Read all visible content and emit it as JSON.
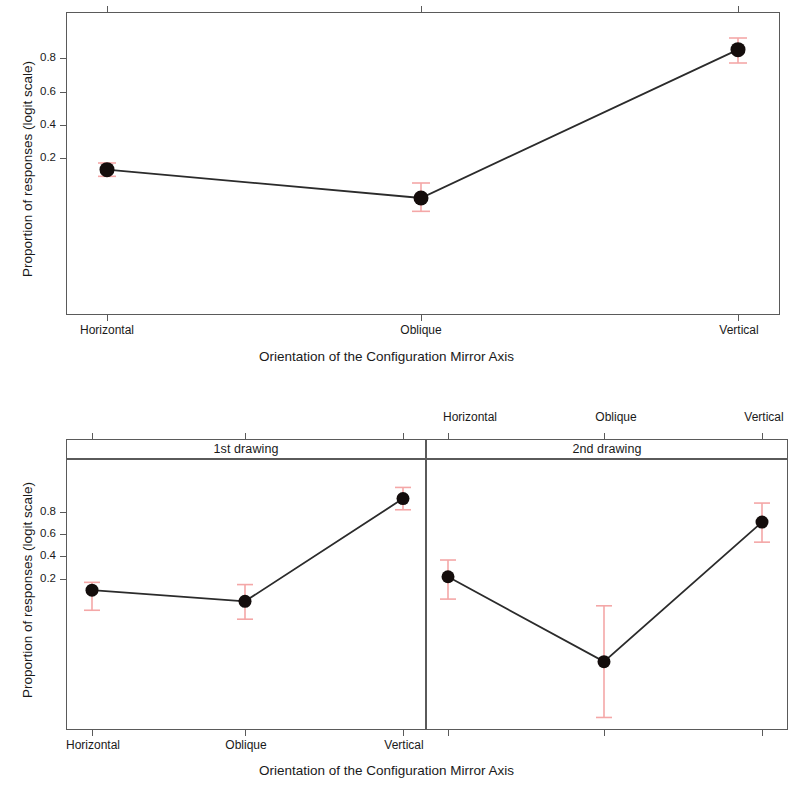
{
  "figure": {
    "ylabel": "Proportion of responses (logit scale)",
    "xlabel": "Orientation of the Configuration Mirror Axis",
    "categories": [
      "Horizontal",
      "Oblique",
      "Vertical"
    ],
    "ytick_labels": [
      "0.2",
      "0.4",
      "0.6",
      "0.8"
    ],
    "strip_labels": [
      "1st drawing",
      "2nd drawing"
    ],
    "colors": {
      "point": "#140d0c",
      "line": "#2b2b2b",
      "error_bar": "#f4a7a7",
      "frame": "#5a5a5a",
      "background": "#ffffff"
    }
  },
  "chart_data": [
    {
      "type": "line",
      "id": "top-panel",
      "title": "",
      "xlabel": "Orientation of the Configuration Mirror Axis",
      "ylabel": "Proportion of responses (logit scale)",
      "categories": [
        "Horizontal",
        "Oblique",
        "Vertical"
      ],
      "values": [
        0.13,
        -0.04,
        0.85
      ],
      "error_low": [
        0.09,
        -0.12,
        0.77
      ],
      "error_high": [
        0.17,
        0.05,
        0.92
      ],
      "ytick_values": [
        0.2,
        0.4,
        0.6,
        0.8
      ],
      "ylim": [
        -0.7,
        1.04
      ],
      "grid": false,
      "legend": "none",
      "xaxis_label_position": "bottom"
    },
    {
      "type": "line",
      "id": "bottom-left-panel",
      "title": "1st drawing",
      "xlabel": "Orientation of the Configuration Mirror Axis",
      "ylabel": "Proportion of responses (logit scale)",
      "categories": [
        "Horizontal",
        "Oblique",
        "Vertical"
      ],
      "values": [
        0.1,
        0.0,
        0.92
      ],
      "error_low": [
        -0.08,
        -0.16,
        0.82
      ],
      "error_high": [
        0.17,
        0.15,
        1.02
      ],
      "ytick_values": [
        0.2,
        0.4,
        0.6,
        0.8
      ],
      "ylim": [
        -0.6,
        1.1
      ],
      "grid": false,
      "legend": "none",
      "xaxis_label_position": "bottom"
    },
    {
      "type": "line",
      "id": "bottom-right-panel",
      "title": "2nd drawing",
      "xlabel": "Orientation of the Configuration Mirror Axis",
      "ylabel": "Proportion of responses (logit scale)",
      "categories": [
        "Horizontal",
        "Oblique",
        "Vertical"
      ],
      "values": [
        0.22,
        -0.54,
        0.71
      ],
      "error_low": [
        0.02,
        -1.04,
        0.53
      ],
      "error_high": [
        0.37,
        -0.04,
        0.88
      ],
      "ytick_values": [
        0.2,
        0.4,
        0.6,
        0.8
      ],
      "ylim": [
        -1.2,
        1.1
      ],
      "grid": false,
      "legend": "none",
      "xaxis_label_position": "top"
    }
  ]
}
